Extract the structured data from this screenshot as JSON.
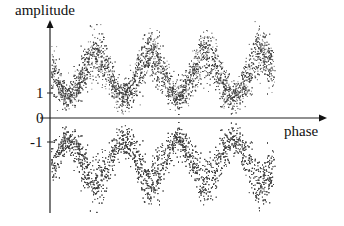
{
  "chart_data": {
    "type": "scatter",
    "title": "",
    "xlabel": "phase",
    "ylabel": "amplitude",
    "ytick_labels": [
      "1",
      "0",
      "-1"
    ],
    "yticks": [
      1,
      0,
      -1
    ],
    "series": [
      {
        "name": "upper band",
        "center_amplitude": 1.6,
        "oscillation_amplitude": 1.3,
        "periods_shown": 4.1
      },
      {
        "name": "lower band",
        "center_amplitude": -1.6,
        "oscillation_amplitude": 1.3,
        "periods_shown": 4.1
      }
    ],
    "node_phase_positions_px": [
      68,
      123,
      178,
      235
    ],
    "grid": false,
    "legend": null,
    "dot_color": "#3a3a3a",
    "axis_color": "#222222"
  },
  "labels": {
    "amplitude": "amplitude",
    "phase": "phase",
    "tick_1": "1",
    "tick_0": "0",
    "tick_m1": "-1"
  }
}
